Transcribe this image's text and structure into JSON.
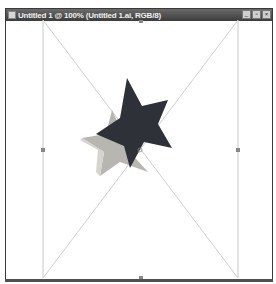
{
  "window": {
    "title": "Untitled 1 @ 100% (Untitled 1.ai, RGB/8)",
    "buttons": [
      {
        "name": "minimize",
        "glyph": "_"
      },
      {
        "name": "restore",
        "glyph": "▫"
      },
      {
        "name": "close",
        "glyph": "×"
      }
    ]
  },
  "canvas": {
    "zoom": "100%",
    "color_mode": "RGB/8",
    "file_name": "Untitled 1.ai",
    "artwork": {
      "shape": "3D star",
      "front_color": "#2e3138",
      "extrude_color": "#b8b6b0",
      "guide_color": "#c8c8c8"
    }
  }
}
